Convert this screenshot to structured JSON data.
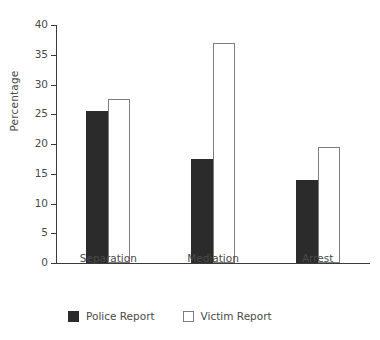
{
  "chart_data": {
    "type": "bar",
    "title": "",
    "subtitle": "",
    "xlabel": "",
    "ylabel": "Percentage",
    "categories": [
      "Separation",
      "Mediation",
      "Arrest"
    ],
    "series": [
      {
        "name": "Police Report",
        "color": "#2b2b2b",
        "values": [
          25.5,
          17.5,
          14.0
        ]
      },
      {
        "name": "Victim Report",
        "color": "#ffffff",
        "values": [
          27.5,
          37.0,
          19.5
        ]
      }
    ],
    "ylim": [
      0,
      40
    ],
    "ytick_labels": [
      "0",
      "5",
      "10",
      "15",
      "20",
      "25",
      "30",
      "35",
      "40"
    ],
    "ytick_values": [
      0,
      5,
      10,
      15,
      20,
      25,
      30,
      35,
      40
    ],
    "grid": false,
    "legend_position": "bottom-left",
    "axis_color": "#3a3a3a",
    "text_color": "#4a4a4a"
  },
  "legend": {
    "entries": [
      {
        "label": "Police Report",
        "style": "dark"
      },
      {
        "label": "Victim Report",
        "style": "light"
      }
    ]
  }
}
